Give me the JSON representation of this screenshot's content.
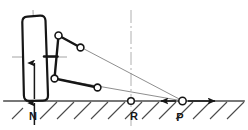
{
  "figure": {
    "type": "technical-line-diagram",
    "width": 248,
    "height": 130,
    "background_color": "#ffffff"
  },
  "colors": {
    "heavy_line": "#161616",
    "thin_line": "#6e6e6e",
    "centerline": "#8c8c8c",
    "ground": "#4a4a4a",
    "hatch": "#4a4a4a",
    "joint_fill": "#ffffff",
    "joint_stroke": "#161616",
    "label": "#161616"
  },
  "labels": [
    {
      "id": "label-n",
      "text": "N",
      "x": 33,
      "y": 120
    },
    {
      "id": "label-r",
      "text": "R",
      "x": 134,
      "y": 120
    },
    {
      "id": "label-p",
      "text": "P",
      "x": 180,
      "y": 121
    }
  ],
  "points": {
    "P": {
      "name": "instantaneous-center",
      "x": 182,
      "y": 101,
      "radius": 3.6
    },
    "R": {
      "name": "roll-center-reference",
      "x": 131,
      "y": 101,
      "radius": 3.2
    },
    "N": {
      "name": "wheel-contact-patch",
      "x": 34,
      "y": 101
    },
    "upper_inner_joint": {
      "x": 58.5,
      "y": 35.5,
      "radius": 3.4
    },
    "upper_outer_joint": {
      "x": 80.5,
      "y": 47.5,
      "radius": 3.4
    },
    "lower_inner_joint": {
      "x": 54.5,
      "y": 78.5,
      "radius": 3.4
    },
    "lower_outer_joint": {
      "x": 97.5,
      "y": 87.5,
      "radius": 3.4
    }
  },
  "wheel": {
    "name": "tilted-wheel-outline",
    "top_left": {
      "x": 21.5,
      "y": 16.5
    },
    "top_right": {
      "x": 44.5,
      "y": 15.5
    },
    "bottom_right": {
      "x": 46.5,
      "y": 100.5
    },
    "bottom_left": {
      "x": 24.5,
      "y": 100.5
    },
    "corner_radius": 6,
    "stroke_width": 2.2,
    "camber_note": "wheel tilted with negative camber"
  },
  "ground": {
    "name": "ground-line",
    "y": 101,
    "x_start": 4,
    "x_end": 244,
    "stroke_width": 1.6,
    "hatch": {
      "count": 13,
      "angle_deg": 45,
      "length": 17,
      "spacing": 17,
      "first_x": 40
    }
  },
  "arrows": {
    "normal_force_up": {
      "name": "normal-force-arrow-up",
      "x": 34,
      "y_from": 98,
      "y_to": 62
    },
    "normal_force_down": {
      "name": "normal-force-arrow-down",
      "x": 34,
      "y_from": 104,
      "y_to": 124
    },
    "lateral_left": {
      "name": "lateral-force-arrow-left",
      "y": 101,
      "x_from": 175,
      "x_to": 161
    },
    "lateral_right": {
      "name": "lateral-force-arrow-right",
      "y": 101,
      "x_from": 189,
      "x_to": 214
    }
  },
  "construction_lines": [
    {
      "name": "upper-arm-extension",
      "from": {
        "x": 58.5,
        "y": 35.5
      },
      "to": {
        "x": 182,
        "y": 101
      }
    },
    {
      "name": "lower-arm-extension",
      "from": {
        "x": 54.5,
        "y": 78.5
      },
      "to": {
        "x": 182,
        "y": 101
      }
    }
  ],
  "centerlines": [
    {
      "name": "wheel-vertical-centerline",
      "x1": 33,
      "y1": 10,
      "x2": 36,
      "y2": 106
    },
    {
      "name": "wheel-horizontal-centerline",
      "x1": 12,
      "y1": 57,
      "x2": 67,
      "y2": 57
    },
    {
      "name": "roll-center-vertical-centerline",
      "x1": 131,
      "y1": 10,
      "x2": 131,
      "y2": 126
    }
  ],
  "links": [
    {
      "name": "steering-knuckle-upright",
      "from": {
        "x": 58.5,
        "y": 35.5
      },
      "to": {
        "x": 54.5,
        "y": 78.5
      }
    },
    {
      "name": "upper-control-arm",
      "from": {
        "x": 58.5,
        "y": 35.5
      },
      "to": {
        "x": 80.5,
        "y": 47.5
      }
    },
    {
      "name": "lower-control-arm",
      "from": {
        "x": 54.5,
        "y": 78.5
      },
      "to": {
        "x": 97.5,
        "y": 87.5
      }
    },
    {
      "name": "hub-stub-axle",
      "from": {
        "x": 44,
        "y": 56.5
      },
      "to": {
        "x": 57,
        "y": 56.5
      }
    }
  ]
}
